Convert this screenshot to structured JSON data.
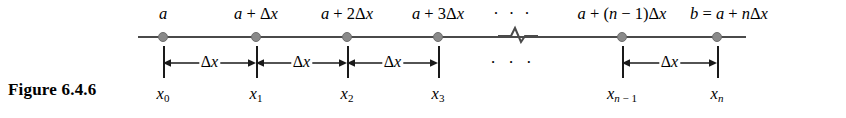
{
  "figure": {
    "caption": "Figure 6.4.6",
    "background_color": "#ffffff",
    "line_color": "#4a4a4a",
    "dot_color": "#8a8a8a",
    "text_color": "#000000"
  },
  "axis": {
    "start_x": 138,
    "end_x": 746,
    "y": 36,
    "break_x": 517
  },
  "top_labels": [
    {
      "text": "a",
      "x": 163
    },
    {
      "text": "a + Δx",
      "x": 256
    },
    {
      "text": "a + 2Δx",
      "x": 347
    },
    {
      "text": "a + 3Δx",
      "x": 438
    },
    {
      "text": "· · ·",
      "x": 513
    },
    {
      "text": "a + (n − 1)Δx",
      "x": 622
    },
    {
      "text": "b = a + nΔx",
      "x": 729
    }
  ],
  "points": [
    {
      "name": "x0",
      "x": 163
    },
    {
      "name": "x1",
      "x": 256
    },
    {
      "name": "x2",
      "x": 347
    },
    {
      "name": "x3",
      "x": 438
    },
    {
      "name": "xn-1",
      "x": 622
    },
    {
      "name": "xn",
      "x": 717
    }
  ],
  "bottom_labels": [
    {
      "base": "x",
      "sub": "0",
      "x": 163
    },
    {
      "base": "x",
      "sub": "1",
      "x": 256
    },
    {
      "base": "x",
      "sub": "2",
      "x": 347
    },
    {
      "base": "x",
      "sub": "3",
      "x": 438
    },
    {
      "base": "x",
      "sub": "n − 1",
      "x": 622
    },
    {
      "base": "x",
      "sub": "n",
      "x": 717
    }
  ],
  "measurements": {
    "label": "Δx",
    "ellipsis": "· · ·",
    "ellipsis_x": 513,
    "ticks": [
      163,
      256,
      347,
      438,
      622,
      717
    ],
    "spans": [
      {
        "from": 163,
        "to": 256,
        "label": "Δx"
      },
      {
        "from": 256,
        "to": 347,
        "label": "Δx"
      },
      {
        "from": 347,
        "to": 438,
        "label": "Δx"
      },
      {
        "from": 622,
        "to": 717,
        "label": "Δx"
      }
    ]
  }
}
